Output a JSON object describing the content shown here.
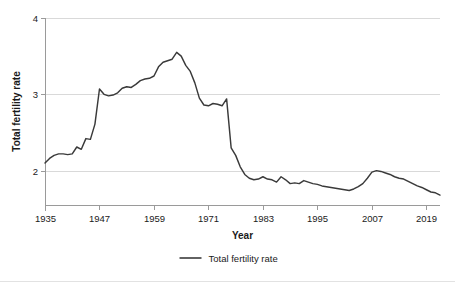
{
  "chart_data": {
    "type": "line",
    "title": "",
    "xlabel": "Year",
    "ylabel": "Total fertility rate",
    "xlim": [
      1935,
      2022
    ],
    "ylim": [
      1.55,
      4
    ],
    "grid": true,
    "legend_position": "bottom-center",
    "y_ticks": [
      "2",
      "3",
      "4"
    ],
    "y_tick_values": [
      2,
      3,
      4
    ],
    "x_ticks": [
      "1935",
      "1947",
      "1959",
      "1971",
      "1983",
      "1995",
      "2007",
      "2019"
    ],
    "x_tick_values": [
      1935,
      1947,
      1959,
      1971,
      1983,
      1995,
      2007,
      2019
    ],
    "series": [
      {
        "name": "Total fertility rate",
        "color": "#3a3a3a",
        "x": [
          1935,
          1936,
          1937,
          1938,
          1939,
          1940,
          1941,
          1942,
          1943,
          1944,
          1945,
          1946,
          1947,
          1948,
          1949,
          1950,
          1951,
          1952,
          1953,
          1954,
          1955,
          1956,
          1957,
          1958,
          1959,
          1960,
          1961,
          1962,
          1963,
          1964,
          1965,
          1966,
          1967,
          1968,
          1969,
          1970,
          1971,
          1972,
          1973,
          1974,
          1975,
          1976,
          1977,
          1978,
          1979,
          1980,
          1981,
          1982,
          1983,
          1984,
          1985,
          1986,
          1987,
          1988,
          1989,
          1990,
          1991,
          1992,
          1993,
          1994,
          1995,
          1996,
          1997,
          1998,
          1999,
          2000,
          2001,
          2002,
          2003,
          2004,
          2005,
          2006,
          2007,
          2008,
          2009,
          2010,
          2011,
          2012,
          2013,
          2014,
          2015,
          2016,
          2017,
          2018,
          2019,
          2020,
          2021,
          2022
        ],
        "values": [
          2.1,
          2.16,
          2.2,
          2.22,
          2.22,
          2.21,
          2.22,
          2.31,
          2.28,
          2.42,
          2.41,
          2.61,
          3.07,
          3.0,
          2.98,
          2.99,
          3.02,
          3.08,
          3.1,
          3.09,
          3.13,
          3.18,
          3.2,
          3.21,
          3.24,
          3.36,
          3.42,
          3.44,
          3.46,
          3.55,
          3.5,
          3.38,
          3.3,
          3.15,
          2.95,
          2.86,
          2.85,
          2.88,
          2.87,
          2.85,
          2.94,
          2.3,
          2.2,
          2.05,
          1.95,
          1.9,
          1.88,
          1.89,
          1.92,
          1.89,
          1.88,
          1.85,
          1.92,
          1.88,
          1.83,
          1.84,
          1.83,
          1.87,
          1.85,
          1.83,
          1.82,
          1.8,
          1.79,
          1.78,
          1.77,
          1.76,
          1.75,
          1.74,
          1.76,
          1.79,
          1.83,
          1.9,
          1.98,
          2.0,
          1.99,
          1.97,
          1.95,
          1.92,
          1.9,
          1.89,
          1.86,
          1.83,
          1.8,
          1.78,
          1.75,
          1.72,
          1.71,
          1.68
        ]
      }
    ],
    "legend": [
      {
        "label": "Total fertility rate",
        "color": "#3a3a3a"
      }
    ]
  }
}
